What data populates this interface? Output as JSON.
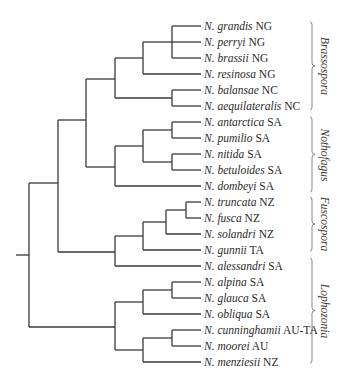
{
  "tree": {
    "row_start_y": 26,
    "row_spacing": 16,
    "tip_x": 201,
    "root_stub": {
      "x1": 16,
      "x2": 29,
      "y": 255
    },
    "taxa": [
      {
        "species": "N. grandis",
        "region": "NG"
      },
      {
        "species": "N. perryi",
        "region": "NG"
      },
      {
        "species": "N. brassii",
        "region": "NG"
      },
      {
        "species": "N. resinosa",
        "region": "NG"
      },
      {
        "species": "N. balansae",
        "region": "NC"
      },
      {
        "species": "N. aequilateralis",
        "region": "NC"
      },
      {
        "species": "N. antarctica",
        "region": "SA"
      },
      {
        "species": "N. pumilio",
        "region": "SA"
      },
      {
        "species": "N. nitida",
        "region": "SA"
      },
      {
        "species": "N. betuloides",
        "region": "SA"
      },
      {
        "species": "N. dombeyi",
        "region": "SA"
      },
      {
        "species": "N. truncata",
        "region": "NZ"
      },
      {
        "species": "N. fusca",
        "region": "NZ"
      },
      {
        "species": "N. solandri",
        "region": "NZ"
      },
      {
        "species": "N. gunnii",
        "region": "TA"
      },
      {
        "species": "N. alessandri",
        "region": "SA"
      },
      {
        "species": "N. alpina",
        "region": "SA"
      },
      {
        "species": "N. glauca",
        "region": "SA"
      },
      {
        "species": "N. obliqua",
        "region": "SA"
      },
      {
        "species": "N. cunninghamii",
        "region": "AU-TA"
      },
      {
        "species": "N. moorei",
        "region": "AU"
      },
      {
        "species": "N. menziesii",
        "region": "NZ"
      }
    ],
    "nodes": [
      {
        "x": 29,
        "y1": 183,
        "y2": 327,
        "children": [
          {
            "y": 183,
            "x2": 58
          },
          {
            "y": 327,
            "x2": 115
          }
        ]
      },
      {
        "x": 58,
        "y1": 120,
        "y2": 252,
        "children": [
          {
            "y": 120,
            "x2": 86
          },
          {
            "y": 252,
            "x2": 115
          }
        ]
      },
      {
        "x": 86,
        "y1": 79,
        "y2": 167,
        "children": [
          {
            "y": 79,
            "x2": 115
          },
          {
            "y": 167,
            "x2": 115
          }
        ]
      },
      {
        "x": 115,
        "y1": 58,
        "y2": 98,
        "children": [
          {
            "y": 58,
            "x2": 143
          },
          {
            "y": 98,
            "x2": 172
          }
        ]
      },
      {
        "x": 143,
        "y1": 42,
        "y2": 74,
        "children": [
          {
            "y": 42,
            "x2": 172
          },
          {
            "y": 74,
            "x2": 201
          }
        ]
      },
      {
        "x": 172,
        "y1": 26,
        "y2": 58,
        "children": [
          {
            "y": 26,
            "x2": 201
          },
          {
            "y": 42,
            "x2": 201
          },
          {
            "y": 58,
            "x2": 201
          }
        ]
      },
      {
        "x": 172,
        "y1": 90,
        "y2": 106,
        "children": [
          {
            "y": 90,
            "x2": 201
          },
          {
            "y": 106,
            "x2": 201
          }
        ]
      },
      {
        "x": 115,
        "y1": 146,
        "y2": 186,
        "children": [
          {
            "y": 146,
            "x2": 143
          },
          {
            "y": 186,
            "x2": 201
          }
        ]
      },
      {
        "x": 143,
        "y1": 130,
        "y2": 162,
        "children": [
          {
            "y": 130,
            "x2": 172
          },
          {
            "y": 162,
            "x2": 172
          }
        ]
      },
      {
        "x": 172,
        "y1": 122,
        "y2": 138,
        "children": [
          {
            "y": 122,
            "x2": 201
          },
          {
            "y": 138,
            "x2": 201
          }
        ]
      },
      {
        "x": 172,
        "y1": 154,
        "y2": 170,
        "children": [
          {
            "y": 154,
            "x2": 201
          },
          {
            "y": 170,
            "x2": 201
          }
        ]
      },
      {
        "x": 115,
        "y1": 236,
        "y2": 266,
        "children": [
          {
            "y": 236,
            "x2": 143
          },
          {
            "y": 266,
            "x2": 201
          }
        ]
      },
      {
        "x": 143,
        "y1": 222,
        "y2": 250,
        "children": [
          {
            "y": 222,
            "x2": 166
          },
          {
            "y": 250,
            "x2": 201
          }
        ]
      },
      {
        "x": 166,
        "y1": 210,
        "y2": 234,
        "children": [
          {
            "y": 210,
            "x2": 186
          },
          {
            "y": 234,
            "x2": 201
          }
        ]
      },
      {
        "x": 186,
        "y1": 202,
        "y2": 218,
        "children": [
          {
            "y": 202,
            "x2": 201
          },
          {
            "y": 218,
            "x2": 201
          }
        ]
      },
      {
        "x": 115,
        "y1": 302,
        "y2": 350,
        "children": [
          {
            "y": 302,
            "x2": 143
          },
          {
            "y": 350,
            "x2": 143
          }
        ]
      },
      {
        "x": 143,
        "y1": 290,
        "y2": 314,
        "children": [
          {
            "y": 290,
            "x2": 172
          },
          {
            "y": 314,
            "x2": 201
          }
        ]
      },
      {
        "x": 172,
        "y1": 282,
        "y2": 298,
        "children": [
          {
            "y": 282,
            "x2": 201
          },
          {
            "y": 298,
            "x2": 201
          }
        ]
      },
      {
        "x": 143,
        "y1": 338,
        "y2": 362,
        "children": [
          {
            "y": 338,
            "x2": 172
          },
          {
            "y": 362,
            "x2": 201
          }
        ]
      },
      {
        "x": 172,
        "y1": 330,
        "y2": 346,
        "children": [
          {
            "y": 330,
            "x2": 201
          },
          {
            "y": 346,
            "x2": 201
          }
        ]
      }
    ]
  },
  "clades": [
    {
      "name": "Brassospora",
      "y1": 22,
      "y2": 110,
      "label_x": 325
    },
    {
      "name": "Nothofagus",
      "y1": 117,
      "y2": 192,
      "label_x": 325
    },
    {
      "name": "Fuscospora",
      "y1": 197,
      "y2": 251,
      "label_x": 325
    },
    {
      "name": "Lophozonia",
      "y1": 258,
      "y2": 363,
      "label_x": 325
    }
  ],
  "colors": {
    "branch": "#3a3a3a",
    "bracket": "#7a7a7a",
    "text": "#2a2a2a"
  }
}
